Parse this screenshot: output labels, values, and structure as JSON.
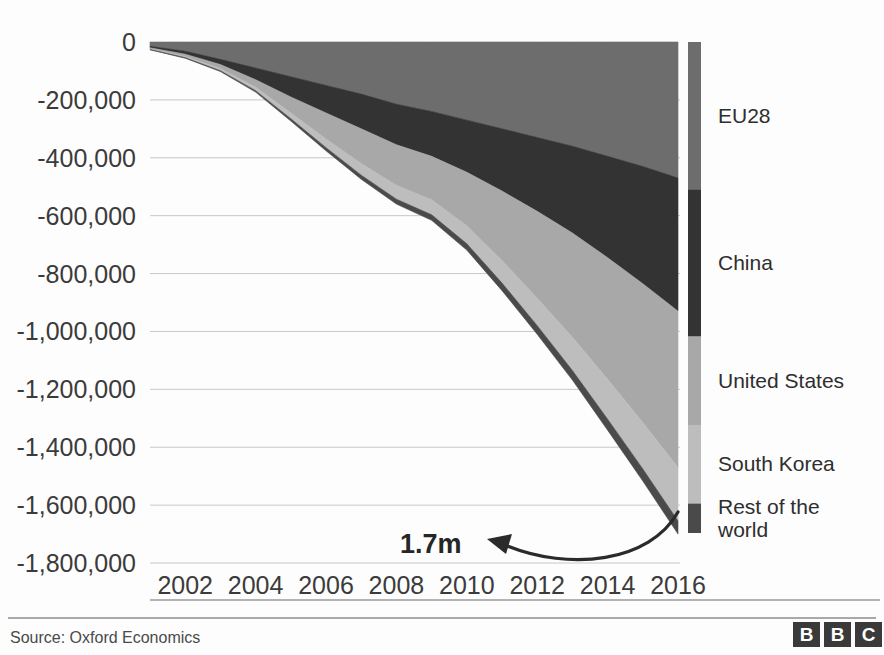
{
  "chart_data": {
    "type": "area",
    "title": "",
    "subtitle": "",
    "xlabel": "",
    "ylabel": "",
    "stacked": true,
    "stack_direction": "negative",
    "grid": true,
    "legend_position": "right",
    "x": [
      2001,
      2002,
      2003,
      2004,
      2005,
      2006,
      2007,
      2008,
      2009,
      2010,
      2011,
      2012,
      2013,
      2014,
      2015,
      2016
    ],
    "xticks": [
      "2002",
      "2004",
      "2006",
      "2008",
      "2010",
      "2012",
      "2014",
      "2016"
    ],
    "xtick_values": [
      2002,
      2004,
      2006,
      2008,
      2010,
      2012,
      2014,
      2016
    ],
    "xlim": [
      2001,
      2016
    ],
    "yticks": [
      "0",
      "-200,000",
      "-400,000",
      "-600,000",
      "-800,000",
      "-1,000,000",
      "-1,200,000",
      "-1,400,000",
      "-1,600,000",
      "-1,800,000"
    ],
    "ytick_values": [
      0,
      -200000,
      -400000,
      -600000,
      -800000,
      -1000000,
      -1200000,
      -1400000,
      -1600000,
      -1800000
    ],
    "ylim": [
      -1800000,
      0
    ],
    "series": [
      {
        "name": "EU28",
        "color": "#6d6d6d",
        "values": [
          -15000,
          -32000,
          -60000,
          -90000,
          -120000,
          -150000,
          -180000,
          -215000,
          -240000,
          -270000,
          -300000,
          -330000,
          -360000,
          -395000,
          -430000,
          -470000
        ]
      },
      {
        "name": "China",
        "color": "#333333",
        "values": [
          -5000,
          -10000,
          -18000,
          -40000,
          -70000,
          -95000,
          -120000,
          -140000,
          -155000,
          -180000,
          -215000,
          -255000,
          -300000,
          -350000,
          -405000,
          -460000
        ]
      },
      {
        "name": "United States",
        "color": "#a8a8a8",
        "values": [
          -4000,
          -8000,
          -14000,
          -26000,
          -55000,
          -90000,
          -120000,
          -140000,
          -150000,
          -185000,
          -240000,
          -300000,
          -360000,
          -420000,
          -480000,
          -540000
        ]
      },
      {
        "name": "South Korea",
        "color": "#bdbdbd",
        "values": [
          -2000,
          -4000,
          -7000,
          -12000,
          -20000,
          -30000,
          -40000,
          -48000,
          -52000,
          -62000,
          -78000,
          -95000,
          -115000,
          -138000,
          -160000,
          -185000
        ]
      },
      {
        "name": "Rest of the world",
        "color": "#4a4a4a",
        "values": [
          -1000,
          -2000,
          -3000,
          -5000,
          -8000,
          -11000,
          -14000,
          -17000,
          -19000,
          -22000,
          -26000,
          -30000,
          -33000,
          -38000,
          -42000,
          -45000
        ]
      }
    ],
    "annotations": [
      {
        "name": "total-2016",
        "text": "1.7m",
        "x": 2014.0,
        "y": -1710000,
        "points_to_x": 2016,
        "points_to_y": -1700000
      }
    ]
  },
  "legend": {
    "items": [
      {
        "label": "EU28",
        "color": "#6d6d6d"
      },
      {
        "label": "China",
        "color": "#333333"
      },
      {
        "label": "United States",
        "color": "#a8a8a8"
      },
      {
        "label": "South Korea",
        "color": "#bdbdbd"
      },
      {
        "label": "Rest of the world",
        "color": "#4a4a4a"
      }
    ]
  },
  "footer": {
    "source": "Source: Oxford Economics",
    "logo": {
      "name": "bbc-logo",
      "letters": [
        "B",
        "B",
        "C"
      ],
      "box_color": "#3a3a3a",
      "text_color": "#ffffff"
    }
  }
}
